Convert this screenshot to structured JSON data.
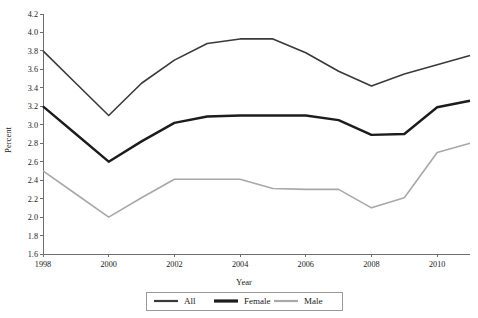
{
  "chart_data": {
    "type": "line",
    "title": "",
    "xlabel": "Year",
    "ylabel": "Percent",
    "xlim": [
      1998,
      2011
    ],
    "ylim": [
      1.6,
      4.2
    ],
    "ytick_step": 0.2,
    "grid": false,
    "legend_position": "bottom-center",
    "x": [
      1998,
      1999,
      2000,
      2001,
      2002,
      2003,
      2004,
      2005,
      2006,
      2007,
      2008,
      2009,
      2010,
      2011
    ],
    "xtick_labels": [
      "1998",
      "2000",
      "2002",
      "2004",
      "2006",
      "2008",
      "2010"
    ],
    "xtick_values": [
      1998,
      2000,
      2002,
      2004,
      2006,
      2008,
      2010
    ],
    "ytick_labels": [
      "1.6",
      "1.8",
      "2.0",
      "2.2",
      "2.4",
      "2.6",
      "2.8",
      "3.0",
      "3.2",
      "3.4",
      "3.6",
      "3.8",
      "4.0",
      "4.2"
    ],
    "ytick_values": [
      1.6,
      1.8,
      2.0,
      2.2,
      2.4,
      2.6,
      2.8,
      3.0,
      3.2,
      3.4,
      3.6,
      3.8,
      4.0,
      4.2
    ],
    "series": [
      {
        "name": "All",
        "color": "#3a3a3a",
        "width": 1.6,
        "values": [
          3.8,
          3.45,
          3.1,
          3.45,
          3.7,
          3.88,
          3.93,
          3.93,
          3.78,
          3.58,
          3.42,
          3.55,
          3.65,
          3.75
        ]
      },
      {
        "name": "Female",
        "color": "#1c1c1c",
        "width": 2.4,
        "values": [
          3.2,
          2.9,
          2.6,
          2.82,
          3.02,
          3.09,
          3.1,
          3.1,
          3.1,
          3.05,
          2.89,
          2.9,
          3.19,
          3.26
        ]
      },
      {
        "name": "Male",
        "color": "#a8a8a8",
        "width": 1.6,
        "values": [
          2.5,
          2.25,
          2.0,
          2.21,
          2.41,
          2.41,
          2.41,
          2.31,
          2.3,
          2.3,
          2.1,
          2.21,
          2.7,
          2.8
        ]
      }
    ]
  },
  "legend": {
    "items": [
      {
        "label": "All",
        "color": "#3a3a3a",
        "width": 2.2
      },
      {
        "label": "Female",
        "color": "#1c1c1c",
        "width": 3.2
      },
      {
        "label": "Male",
        "color": "#a8a8a8",
        "width": 2.2
      }
    ]
  },
  "caption": {
    "text": ""
  }
}
